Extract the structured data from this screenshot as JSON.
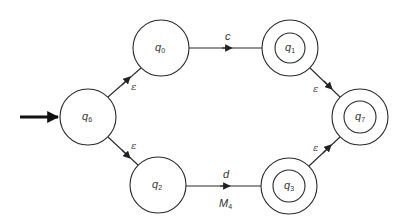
{
  "diagram": {
    "type": "NFA state diagram",
    "caption": {
      "main": "M",
      "sub": "4"
    },
    "start_state": "q6",
    "states": [
      {
        "id": "q0",
        "label": "q",
        "sub": "0",
        "accepting": false
      },
      {
        "id": "q1",
        "label": "q",
        "sub": "1",
        "accepting": true
      },
      {
        "id": "q2",
        "label": "q",
        "sub": "2",
        "accepting": false
      },
      {
        "id": "q3",
        "label": "q",
        "sub": "3",
        "accepting": true
      },
      {
        "id": "q6",
        "label": "q",
        "sub": "6",
        "accepting": false
      },
      {
        "id": "q7",
        "label": "q",
        "sub": "7",
        "accepting": true
      }
    ],
    "transitions": [
      {
        "from": "q6",
        "to": "q0",
        "label": "ε"
      },
      {
        "from": "q6",
        "to": "q2",
        "label": "ε"
      },
      {
        "from": "q0",
        "to": "q1",
        "label": "c"
      },
      {
        "from": "q2",
        "to": "q3",
        "label": "d"
      },
      {
        "from": "q1",
        "to": "q7",
        "label": "ε"
      },
      {
        "from": "q3",
        "to": "q7",
        "label": "ε"
      }
    ],
    "colors": {
      "stroke": "#2a2a2a",
      "text": "#333333",
      "background": "#ffffff"
    }
  }
}
